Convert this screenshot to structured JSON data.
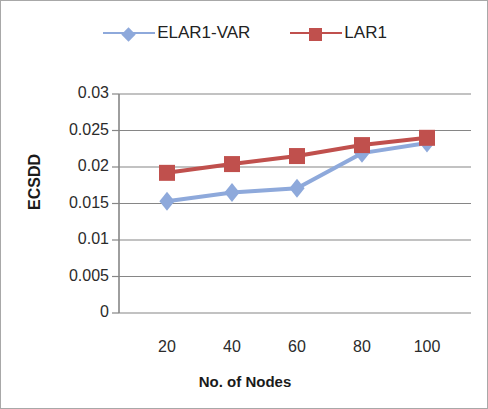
{
  "chart_data": {
    "type": "line",
    "title": "",
    "xlabel": "No. of Nodes",
    "ylabel": "ECSDD",
    "categories": [
      20,
      40,
      60,
      80,
      100
    ],
    "x_tick_labels": [
      "20",
      "40",
      "60",
      "80",
      "100"
    ],
    "y_tick_labels": [
      "0",
      "0.005",
      "0.01",
      "0.015",
      "0.02",
      "0.025",
      "0.03"
    ],
    "y_tick_values": [
      0,
      0.005,
      0.01,
      0.015,
      0.02,
      0.025,
      0.03
    ],
    "ylim": [
      0,
      0.03
    ],
    "grid": "horizontal",
    "legend_position": "top-center",
    "series": [
      {
        "name": "ELAR1-VAR",
        "color": "#8ea9db",
        "marker": "diamond",
        "values": [
          0.0153,
          0.0165,
          0.0171,
          0.0219,
          0.0233
        ]
      },
      {
        "name": "LAR1",
        "color": "#c0504d",
        "marker": "square",
        "values": [
          0.0192,
          0.0204,
          0.0215,
          0.023,
          0.024
        ]
      }
    ]
  },
  "legend": {
    "entries": [
      {
        "label": "ELAR1-VAR"
      },
      {
        "label": "LAR1"
      }
    ]
  },
  "axes": {
    "y_title": "ECSDD",
    "x_title": "No. of Nodes"
  },
  "colors": {
    "series_blue": "#8ea9db",
    "series_red": "#c0504d",
    "gridline": "#868686",
    "axis": "#868686",
    "text": "#2b2b2b",
    "border": "#a8a8a8",
    "background": "#ffffff"
  }
}
